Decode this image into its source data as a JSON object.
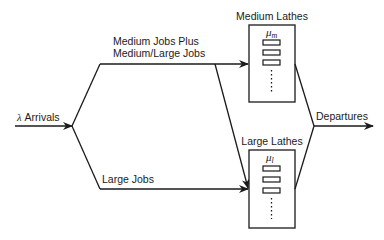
{
  "diagram": {
    "type": "queueing-network",
    "arrivals": {
      "symbol": "λ",
      "label": "Arrivals"
    },
    "departures": {
      "label": "Departures"
    },
    "branches": {
      "upper": {
        "label_line1": "Medium Jobs Plus",
        "label_line2": "Medium/Large Jobs"
      },
      "lower": {
        "label": "Large Jobs"
      }
    },
    "stations": [
      {
        "id": "medium",
        "title": "Medium Lathes",
        "rate_symbol": "μ",
        "rate_subscript": "m"
      },
      {
        "id": "large",
        "title": "Large Lathes",
        "rate_symbol": "μ",
        "rate_subscript": "l"
      }
    ],
    "colors": {
      "stroke": "#1a1a1a",
      "background": "#ffffff"
    }
  }
}
